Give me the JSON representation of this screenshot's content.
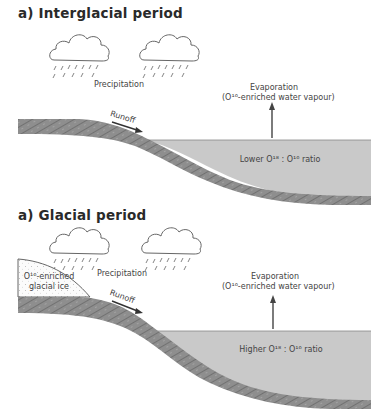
{
  "panels": [
    {
      "title": "a) Interglacial period",
      "precipitation_label": "Precipitation",
      "evaporation_label": "Evaporation",
      "evaporation_sub": "(O¹⁶-enriched water vapour)",
      "runoff_label": "Runoff",
      "ocean_label": "Lower O¹⁸ : O¹⁶ ratio"
    },
    {
      "title": "a) Glacial period",
      "precipitation_label": "Precipitation",
      "evaporation_label": "Evaporation",
      "evaporation_sub": "(O¹⁶-enriched water vapour)",
      "runoff_label": "Runoff",
      "ocean_label": "Higher O¹⁸ : O¹⁶ ratio",
      "ice_label_line1": "O¹⁶-enriched",
      "ice_label_line2": "glacial ice"
    }
  ],
  "colors": {
    "ocean": "#c9c9c9",
    "rock": "#8a8a8a",
    "rock_hatch": "#5e5e5e",
    "ice_dots": "#b0b0b0",
    "line": "#555555"
  }
}
